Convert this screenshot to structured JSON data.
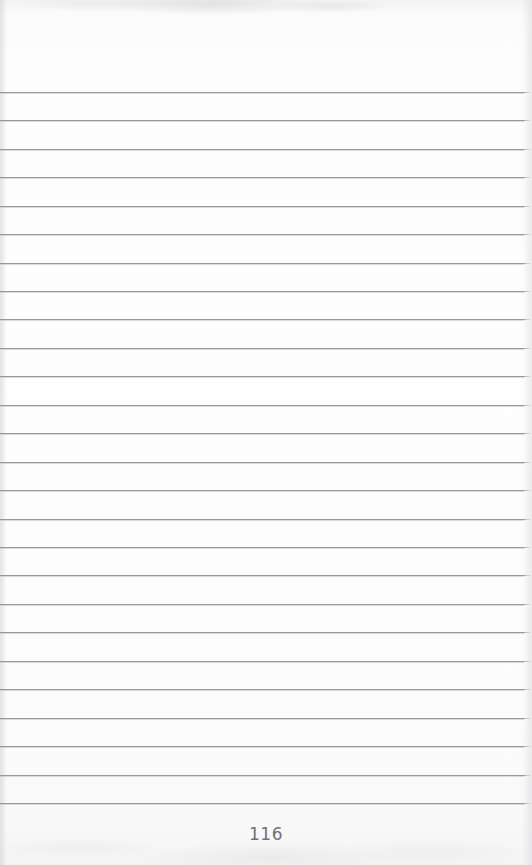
{
  "page": {
    "kind": "scanned-ruled-notebook-page",
    "width": 532,
    "height": 865,
    "background_color": "#fdfdfd",
    "top_margin_px": 92,
    "folio_label": "116"
  },
  "ruling": {
    "line_color": "#8f9194",
    "line_thickness_px": 1,
    "line_count": 26,
    "first_line_y": 92,
    "line_spacing_px": 28.45,
    "left_x": 0,
    "right_x": 524,
    "lines": [
      {
        "index": 1,
        "y": 92,
        "text": ""
      },
      {
        "index": 2,
        "y": 120,
        "text": ""
      },
      {
        "index": 3,
        "y": 149,
        "text": ""
      },
      {
        "index": 4,
        "y": 177,
        "text": ""
      },
      {
        "index": 5,
        "y": 206,
        "text": ""
      },
      {
        "index": 6,
        "y": 234,
        "text": ""
      },
      {
        "index": 7,
        "y": 263,
        "text": ""
      },
      {
        "index": 8,
        "y": 291,
        "text": ""
      },
      {
        "index": 9,
        "y": 319,
        "text": ""
      },
      {
        "index": 10,
        "y": 348,
        "text": ""
      },
      {
        "index": 11,
        "y": 376,
        "text": ""
      },
      {
        "index": 12,
        "y": 405,
        "text": ""
      },
      {
        "index": 13,
        "y": 433,
        "text": ""
      },
      {
        "index": 14,
        "y": 462,
        "text": ""
      },
      {
        "index": 15,
        "y": 490,
        "text": ""
      },
      {
        "index": 16,
        "y": 519,
        "text": ""
      },
      {
        "index": 17,
        "y": 547,
        "text": ""
      },
      {
        "index": 18,
        "y": 575,
        "text": ""
      },
      {
        "index": 19,
        "y": 604,
        "text": ""
      },
      {
        "index": 20,
        "y": 632,
        "text": ""
      },
      {
        "index": 21,
        "y": 661,
        "text": ""
      },
      {
        "index": 22,
        "y": 689,
        "text": ""
      },
      {
        "index": 23,
        "y": 718,
        "text": ""
      },
      {
        "index": 24,
        "y": 746,
        "text": ""
      },
      {
        "index": 25,
        "y": 775,
        "text": ""
      },
      {
        "index": 26,
        "y": 803,
        "text": ""
      }
    ]
  },
  "folio": {
    "text": "116",
    "y": 824,
    "color": "#6f7276",
    "font_size_px": 17,
    "align": "center"
  }
}
